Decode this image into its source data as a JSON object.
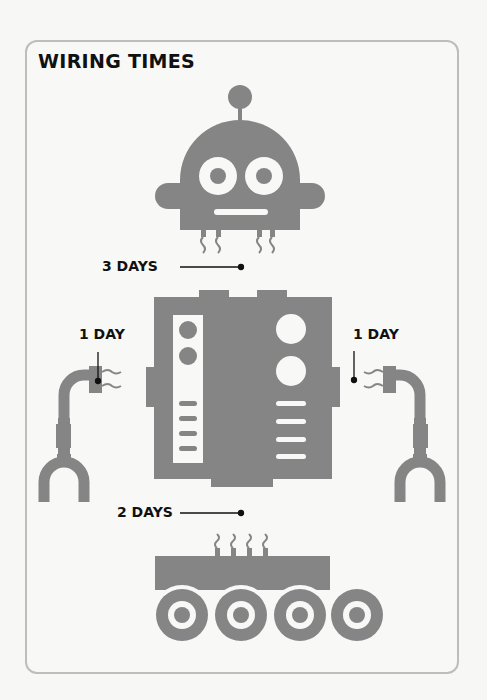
{
  "title": "WIRING TIMES",
  "colors": {
    "part": "#858585",
    "hole": "#f8f8f7",
    "text": "#111111",
    "frame": "#bdbdbd"
  },
  "parts": [
    {
      "name": "head",
      "label": "3 DAYS"
    },
    {
      "name": "left-arm",
      "label": "1 DAY"
    },
    {
      "name": "torso",
      "label": ""
    },
    {
      "name": "right-arm",
      "label": "1 DAY"
    },
    {
      "name": "base",
      "label": "2 DAYS"
    }
  ],
  "labels": {
    "head": "3 DAYS",
    "left_arm": "1 DAY",
    "right_arm": "1 DAY",
    "base": "2 DAYS"
  }
}
